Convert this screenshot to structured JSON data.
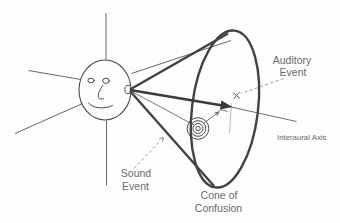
{
  "diagram": {
    "labels": {
      "auditory_event_line1": "Auditory",
      "auditory_event_line2": "Event",
      "interaural_axis": "Interaural Axis",
      "sound_event_line1": "Sound",
      "sound_event_line2": "Event",
      "cone_of_confusion_line1": "Cone of",
      "cone_of_confusion_line2": "Confusion"
    },
    "icons": {
      "listener": "smiley-face-head-icon",
      "sound_source": "concentric-circles-icon",
      "auditory_event_marker": "x-mark-icon"
    },
    "colors": {
      "line": "#424242",
      "thin_line": "#555555",
      "leader_dash": "#8a8a8a",
      "text": "#6a6a6a",
      "background": "#fdfdfd"
    }
  }
}
